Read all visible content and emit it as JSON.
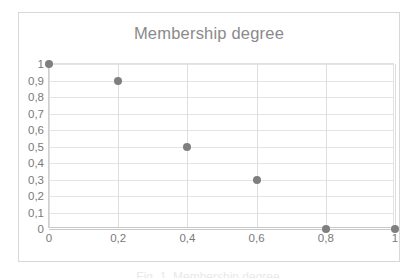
{
  "figure": {
    "caption_fragment": "Fig. 1. Membership degree"
  },
  "chart_data": {
    "type": "scatter",
    "title": "Membership degree",
    "xlabel": "",
    "ylabel": "",
    "xlim": [
      0,
      1
    ],
    "ylim": [
      0,
      1
    ],
    "grid": true,
    "legend": false,
    "marker_color": "#7f7f7f",
    "x": [
      0,
      0.2,
      0.4,
      0.6,
      0.8,
      1
    ],
    "values": [
      1,
      0.9,
      0.5,
      0.3,
      0,
      0
    ],
    "points": [
      {
        "x": 0,
        "y": 1
      },
      {
        "x": 0.2,
        "y": 0.9
      },
      {
        "x": 0.4,
        "y": 0.5
      },
      {
        "x": 0.6,
        "y": 0.3
      },
      {
        "x": 0.8,
        "y": 0
      },
      {
        "x": 1,
        "y": 0
      }
    ],
    "ytick_values": [
      0,
      0.1,
      0.2,
      0.3,
      0.4,
      0.5,
      0.6,
      0.7,
      0.8,
      0.9,
      1
    ],
    "ytick_labels": [
      "0",
      "0,1",
      "0,2",
      "0,3",
      "0,4",
      "0,5",
      "0,6",
      "0,7",
      "0,8",
      "0,9",
      "1"
    ],
    "xtick_values": [
      0,
      0.2,
      0.4,
      0.6,
      0.8,
      1
    ],
    "xtick_labels": [
      "0",
      "0,2",
      "0,4",
      "0,6",
      "0,8",
      "1"
    ]
  }
}
